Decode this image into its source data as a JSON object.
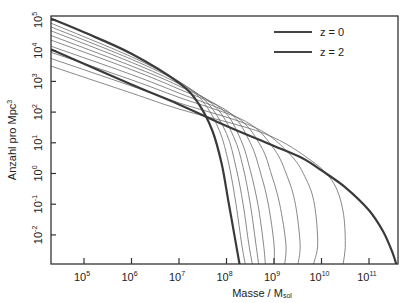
{
  "chart_data": {
    "type": "line",
    "title": "",
    "xlabel": "Masse / M",
    "xlabel_sub": "sol",
    "ylabel": "Anzahl pro Mpc",
    "ylabel_sup": "3",
    "x_scale": "log",
    "y_scale": "log",
    "xlim_log10": [
      4.3,
      11.6
    ],
    "ylim_log10": [
      -3.0,
      5.1
    ],
    "grid": false,
    "legend_position": "upper right",
    "x_ticks": [
      {
        "base": "10",
        "exp": "5",
        "log": 5
      },
      {
        "base": "10",
        "exp": "6",
        "log": 6
      },
      {
        "base": "10",
        "exp": "7",
        "log": 7
      },
      {
        "base": "10",
        "exp": "8",
        "log": 8
      },
      {
        "base": "10",
        "exp": "9",
        "log": 9
      },
      {
        "base": "10",
        "exp": "10",
        "log": 10
      },
      {
        "base": "10",
        "exp": "11",
        "log": 11
      }
    ],
    "y_ticks": [
      {
        "base": "10",
        "exp": "5",
        "log": 5
      },
      {
        "base": "10",
        "exp": "4",
        "log": 4
      },
      {
        "base": "10",
        "exp": "3",
        "log": 3
      },
      {
        "base": "10",
        "exp": "2",
        "log": 2
      },
      {
        "base": "10",
        "exp": "1",
        "log": 1
      },
      {
        "base": "10",
        "exp": "0",
        "log": 0
      },
      {
        "base": "10",
        "exp": "-1",
        "log": -1
      },
      {
        "base": "10",
        "exp": "-2",
        "log": -2
      }
    ],
    "legend": [
      {
        "label": "z = 0",
        "style": "thick"
      },
      {
        "label": "z = 2",
        "style": "thick"
      }
    ],
    "series": [
      {
        "name": "z = 0",
        "weight": "thick",
        "points_log10": [
          [
            4.3,
            4.05
          ],
          [
            6,
            2.9
          ],
          [
            7,
            2.25
          ],
          [
            8,
            1.55
          ],
          [
            9,
            0.9
          ],
          [
            9.6,
            0.5
          ],
          [
            10,
            0.1
          ],
          [
            10.5,
            -0.45
          ],
          [
            11,
            -1.2
          ],
          [
            11.3,
            -1.9
          ],
          [
            11.5,
            -2.6
          ],
          [
            11.58,
            -3.0
          ]
        ]
      },
      {
        "name": "z = 2",
        "weight": "thick",
        "points_log10": [
          [
            4.3,
            5.05
          ],
          [
            5,
            4.6
          ],
          [
            6,
            3.9
          ],
          [
            7,
            2.95
          ],
          [
            7.4,
            2.3
          ],
          [
            7.7,
            1.4
          ],
          [
            7.9,
            0.3
          ],
          [
            8.05,
            -1.0
          ],
          [
            8.2,
            -2.3
          ],
          [
            8.28,
            -3.0
          ]
        ]
      },
      {
        "name": "intermediate 1",
        "weight": "thin",
        "points_log10": [
          [
            4.3,
            4.9
          ],
          [
            6,
            3.8
          ],
          [
            7,
            3.0
          ],
          [
            7.5,
            2.35
          ],
          [
            7.85,
            1.4
          ],
          [
            8.05,
            0.3
          ],
          [
            8.2,
            -1.0
          ],
          [
            8.32,
            -2.3
          ],
          [
            8.4,
            -3.0
          ]
        ]
      },
      {
        "name": "intermediate 2",
        "weight": "thin",
        "points_log10": [
          [
            4.3,
            4.78
          ],
          [
            6,
            3.72
          ],
          [
            7,
            2.98
          ],
          [
            7.6,
            2.3
          ],
          [
            8.0,
            1.3
          ],
          [
            8.2,
            0.2
          ],
          [
            8.35,
            -1.0
          ],
          [
            8.47,
            -2.3
          ],
          [
            8.55,
            -3.0
          ]
        ]
      },
      {
        "name": "intermediate 3",
        "weight": "thin",
        "points_log10": [
          [
            4.3,
            4.65
          ],
          [
            6,
            3.62
          ],
          [
            7,
            2.92
          ],
          [
            7.75,
            2.2
          ],
          [
            8.15,
            1.2
          ],
          [
            8.35,
            0.2
          ],
          [
            8.5,
            -1.0
          ],
          [
            8.62,
            -2.3
          ],
          [
            8.68,
            -3.0
          ]
        ]
      },
      {
        "name": "intermediate 4",
        "weight": "thin",
        "points_log10": [
          [
            4.3,
            4.5
          ],
          [
            6,
            3.5
          ],
          [
            7,
            2.85
          ],
          [
            7.9,
            2.1
          ],
          [
            8.3,
            1.1
          ],
          [
            8.5,
            0.1
          ],
          [
            8.66,
            -1.0
          ],
          [
            8.78,
            -2.3
          ],
          [
            8.82,
            -3.0
          ]
        ]
      },
      {
        "name": "intermediate 5",
        "weight": "thin",
        "points_log10": [
          [
            4.3,
            4.35
          ],
          [
            6,
            3.38
          ],
          [
            7,
            2.75
          ],
          [
            8.05,
            2.0
          ],
          [
            8.5,
            1.0
          ],
          [
            8.72,
            0.0
          ],
          [
            8.88,
            -1.0
          ],
          [
            9.0,
            -2.3
          ],
          [
            9.0,
            -3.0
          ]
        ]
      },
      {
        "name": "intermediate 6",
        "weight": "thin",
        "points_log10": [
          [
            4.3,
            4.15
          ],
          [
            6,
            3.22
          ],
          [
            7,
            2.62
          ],
          [
            8.2,
            1.85
          ],
          [
            8.72,
            0.9
          ],
          [
            8.95,
            -0.05
          ],
          [
            9.12,
            -1.0
          ],
          [
            9.25,
            -2.3
          ],
          [
            9.22,
            -3.0
          ]
        ]
      },
      {
        "name": "intermediate 7",
        "weight": "thin",
        "points_log10": [
          [
            4.3,
            3.95
          ],
          [
            6,
            3.05
          ],
          [
            7,
            2.48
          ],
          [
            8.4,
            1.7
          ],
          [
            9.0,
            0.8
          ],
          [
            9.28,
            -0.1
          ],
          [
            9.45,
            -1.0
          ],
          [
            9.55,
            -2.3
          ],
          [
            9.5,
            -3.0
          ]
        ]
      },
      {
        "name": "intermediate 8",
        "weight": "thin",
        "points_log10": [
          [
            4.3,
            3.75
          ],
          [
            6,
            2.85
          ],
          [
            7,
            2.3
          ],
          [
            8.6,
            1.5
          ],
          [
            9.35,
            0.6
          ],
          [
            9.68,
            -0.2
          ],
          [
            9.85,
            -1.0
          ],
          [
            9.92,
            -2.3
          ],
          [
            9.82,
            -3.0
          ]
        ]
      },
      {
        "name": "intermediate 9",
        "weight": "thin",
        "points_log10": [
          [
            4.3,
            3.5
          ],
          [
            6,
            2.62
          ],
          [
            7,
            2.1
          ],
          [
            8.8,
            1.3
          ],
          [
            9.8,
            0.4
          ],
          [
            10.25,
            -0.3
          ],
          [
            10.45,
            -1.2
          ],
          [
            10.5,
            -2.3
          ],
          [
            10.45,
            -3.0
          ]
        ]
      }
    ]
  }
}
